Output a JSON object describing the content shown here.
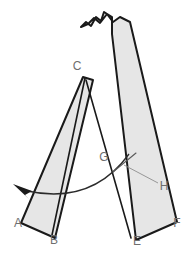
{
  "figure": {
    "background_color": "#ffffff",
    "strip_fill_color": "#e6e6e6",
    "strip_outline_color": "#1a1a1a",
    "label_color": "#6e6e6e",
    "arc_color": "#2b2b2b",
    "leader_color": "#8d8d8d",
    "width": 190,
    "height": 261
  },
  "labels": [
    {
      "id": "A",
      "text": "A",
      "x": 18,
      "y": 224
    },
    {
      "id": "B",
      "text": "B",
      "x": 54,
      "y": 241
    },
    {
      "id": "C",
      "text": "C",
      "x": 77,
      "y": 67
    },
    {
      "id": "E",
      "text": "E",
      "x": 137,
      "y": 242
    },
    {
      "id": "F",
      "text": "F",
      "x": 177,
      "y": 224
    },
    {
      "id": "G",
      "text": "G",
      "x": 104,
      "y": 158
    },
    {
      "id": "H",
      "text": "H",
      "x": 164,
      "y": 187
    }
  ],
  "shapes": {
    "right_strip": {
      "name": "right-strip",
      "description": "Long strip with torn top edge running from upper area down to E-F",
      "path": "M 81,27 L 86,22 L 91,26 L 96,17 L 101,21 L 104,12 L 112,17 L 112,34 L 136,240 L 177,222 L 130,22 L 120,17 L 113,22 L 107,14 L 100,23 L 94,18 L 88,24 Z"
    },
    "left_strip": {
      "name": "left-strip",
      "description": "Strip from apex C down-left to A-B bottom end",
      "path": "M 83,77 L 93,80 L 55,238 L 21,223 Z"
    },
    "left_strip_fold": {
      "name": "left-strip-fold-line",
      "path": "M 85,78 L 52,235"
    },
    "right_strip_inner_edge": {
      "name": "right-strip-inner-edge",
      "path": "M 86,80 L 131,238"
    }
  },
  "annotations": {
    "rotation_arc": {
      "name": "rotation-arc",
      "path": "M 129,154 Q 92,205 27,191",
      "arrow_tip": {
        "x": 13,
        "y": 184
      },
      "arrow_polygon": "13,184 32,191 25,195 30,200"
    },
    "h_leader": {
      "name": "h-leader-line",
      "path": "M 124,165 L 158,183"
    },
    "g_pointer": {
      "name": "g-pointer-line",
      "path": "M 136,153 L 113,172"
    }
  }
}
